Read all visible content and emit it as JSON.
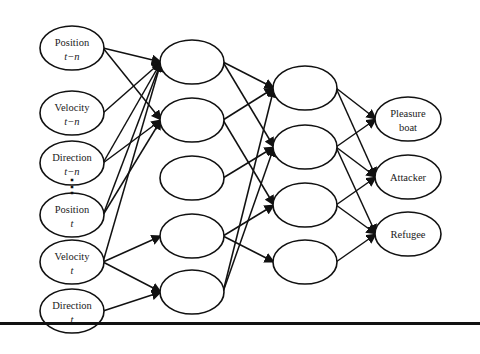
{
  "diagram": {
    "type": "neural-network",
    "colors": {
      "stroke": "#111111",
      "background": "#ffffff",
      "text": "#1a1a1a"
    },
    "ellipsis": "⋮",
    "layers": [
      {
        "name": "input",
        "cx": 72,
        "rx": 32,
        "ry": 22,
        "nodes": [
          {
            "id": "pos_tn",
            "line1": "Position",
            "line2": "t−n",
            "cy": 48
          },
          {
            "id": "vel_tn",
            "line1": "Velocity",
            "line2": "t−n",
            "cy": 113
          },
          {
            "id": "dir_tn",
            "line1": "Direction",
            "line2": "t−n",
            "cy": 163
          },
          {
            "id": "pos_t",
            "line1": "Position",
            "line2": "t",
            "cy": 215
          },
          {
            "id": "vel_t",
            "line1": "Velocity",
            "line2": "t",
            "cy": 262
          },
          {
            "id": "dir_t",
            "line1": "Direction",
            "line2": "t",
            "cy": 311
          }
        ]
      },
      {
        "name": "hidden1",
        "cx": 192,
        "rx": 32,
        "ry": 22,
        "nodes": [
          {
            "id": "h1a",
            "cy": 62
          },
          {
            "id": "h1b",
            "cy": 120
          },
          {
            "id": "h1c",
            "cy": 178
          },
          {
            "id": "h1d",
            "cy": 236
          },
          {
            "id": "h1e",
            "cy": 292
          }
        ]
      },
      {
        "name": "hidden2",
        "cx": 305,
        "rx": 32,
        "ry": 22,
        "nodes": [
          {
            "id": "h2a",
            "cy": 88
          },
          {
            "id": "h2b",
            "cy": 147
          },
          {
            "id": "h2c",
            "cy": 205
          },
          {
            "id": "h2d",
            "cy": 262
          }
        ]
      },
      {
        "name": "output",
        "cx": 408,
        "rx": 33,
        "ry": 22,
        "nodes": [
          {
            "id": "o_pleasure",
            "line1": "Pleasure",
            "line2": "boat",
            "cy": 119
          },
          {
            "id": "o_attacker",
            "line1": "Attacker",
            "line2": "",
            "cy": 177
          },
          {
            "id": "o_refugee",
            "line1": "Refugee",
            "line2": "",
            "cy": 234
          }
        ]
      }
    ],
    "edges": [
      [
        "pos_tn",
        "h1a"
      ],
      [
        "pos_tn",
        "h1b"
      ],
      [
        "vel_tn",
        "h1a"
      ],
      [
        "dir_tn",
        "h1a"
      ],
      [
        "dir_tn",
        "h1b"
      ],
      [
        "pos_t",
        "h1a"
      ],
      [
        "pos_t",
        "h1b"
      ],
      [
        "vel_t",
        "h1a"
      ],
      [
        "vel_t",
        "h1d"
      ],
      [
        "vel_t",
        "h1e"
      ],
      [
        "dir_t",
        "h1e"
      ],
      [
        "h1a",
        "h2a"
      ],
      [
        "h1a",
        "h2b"
      ],
      [
        "h1b",
        "h2a"
      ],
      [
        "h1b",
        "h2c"
      ],
      [
        "h1c",
        "h2b"
      ],
      [
        "h1d",
        "h2c"
      ],
      [
        "h1d",
        "h2d"
      ],
      [
        "h1e",
        "h2a"
      ],
      [
        "h1e",
        "h2b"
      ],
      [
        "h2a",
        "o_pleasure"
      ],
      [
        "h2a",
        "o_attacker"
      ],
      [
        "h2b",
        "o_pleasure"
      ],
      [
        "h2b",
        "o_attacker"
      ],
      [
        "h2b",
        "o_refugee"
      ],
      [
        "h2c",
        "o_attacker"
      ],
      [
        "h2c",
        "o_refugee"
      ],
      [
        "h2d",
        "o_refugee"
      ]
    ]
  }
}
